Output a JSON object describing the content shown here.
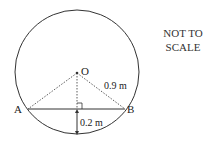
{
  "diagram": {
    "note_line1": "NOT TO",
    "note_line2": "SCALE",
    "center_label": "O",
    "point_a_label": "A",
    "point_b_label": "B",
    "radius_label": "0.9 m",
    "depth_label": "0.2 m"
  }
}
